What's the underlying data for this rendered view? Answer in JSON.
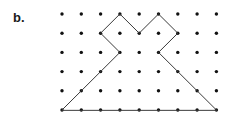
{
  "figure": {
    "label": "b.",
    "caption_position": "left",
    "background_color": "#ffffff"
  },
  "lattice": {
    "columns": 9,
    "rows": 6,
    "origin_x": 62,
    "origin_y": 14,
    "spacing_x": 19.3,
    "spacing_y": 19.2,
    "dot_radius": 1.7,
    "dot_color": "#111111"
  },
  "shape": {
    "name": "crown-arrow-polygon",
    "stroke_color": "#3a3a3a",
    "stroke_width": 1,
    "closed": true,
    "vertices_grid": [
      [
        0,
        5
      ],
      [
        3,
        2
      ],
      [
        2,
        1
      ],
      [
        3,
        0
      ],
      [
        4,
        1
      ],
      [
        5,
        0
      ],
      [
        6,
        1
      ],
      [
        5,
        2
      ],
      [
        8,
        5
      ]
    ]
  }
}
